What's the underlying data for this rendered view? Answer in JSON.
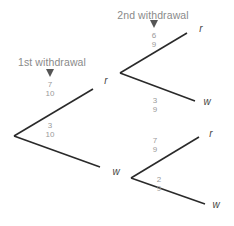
{
  "diagram": {
    "type": "probability-tree",
    "headers": {
      "first": "1st withdrawal",
      "second": "2nd withdrawal"
    },
    "stage1": {
      "branches": [
        {
          "outcome": "r",
          "numerator": "7",
          "denominator": "10"
        },
        {
          "outcome": "w",
          "numerator": "3",
          "denominator": "10"
        }
      ]
    },
    "stage2_after_r": {
      "branches": [
        {
          "outcome": "r",
          "numerator": "6",
          "denominator": "9"
        },
        {
          "outcome": "w",
          "numerator": "3",
          "denominator": "9"
        }
      ]
    },
    "stage2_after_w": {
      "branches": [
        {
          "outcome": "r",
          "numerator": "7",
          "denominator": "9"
        },
        {
          "outcome": "w",
          "numerator": "2",
          "denominator": "9"
        }
      ]
    },
    "colors": {
      "line": "#2a2a2a",
      "text": "#8a8a8a"
    }
  }
}
